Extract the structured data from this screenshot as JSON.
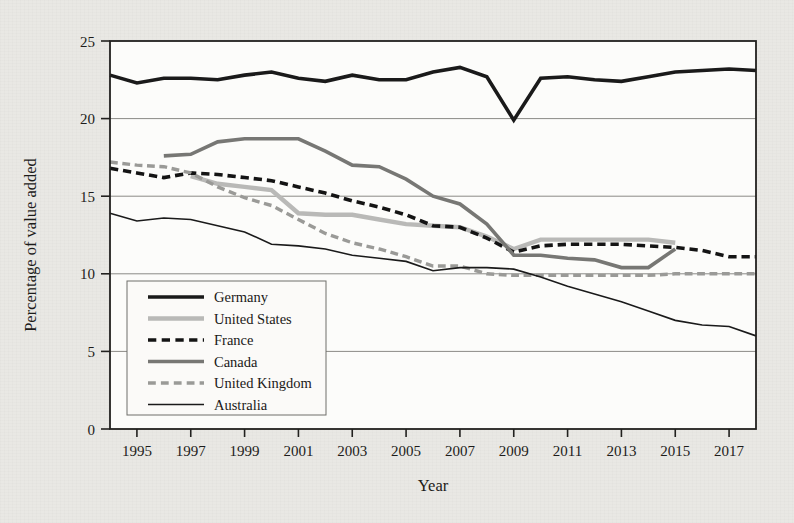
{
  "figure": {
    "background_color": "#e9e8e4",
    "plot_background_color": "#fcfcfa"
  },
  "chart_data": {
    "type": "line",
    "title": "",
    "xlabel": "Year",
    "ylabel": "Percentage of value added",
    "xlim": [
      1994,
      2018
    ],
    "ylim": [
      0,
      25
    ],
    "grid": "horizontal",
    "legend_position": "lower-left-inside",
    "x_tick_labels": [
      "1995",
      "1997",
      "1999",
      "2001",
      "2003",
      "2005",
      "2007",
      "2009",
      "2011",
      "2013",
      "2015",
      "2017"
    ],
    "x_ticks": [
      1995,
      1997,
      1999,
      2001,
      2003,
      2005,
      2007,
      2009,
      2011,
      2013,
      2015,
      2017
    ],
    "y_tick_labels": [
      "0",
      "5",
      "10",
      "15",
      "20",
      "25"
    ],
    "y_ticks": [
      0,
      5,
      10,
      15,
      20,
      25
    ],
    "series": [
      {
        "name": "Germany",
        "color": "#1a1a1a",
        "style": "solid",
        "width": 3.6,
        "x": [
          1994,
          1995,
          1996,
          1997,
          1998,
          1999,
          2000,
          2001,
          2002,
          2003,
          2004,
          2005,
          2006,
          2007,
          2008,
          2009,
          2010,
          2011,
          2012,
          2013,
          2014,
          2015,
          2016,
          2017,
          2018
        ],
        "values": [
          22.8,
          22.3,
          22.6,
          22.6,
          22.5,
          22.8,
          23.0,
          22.6,
          22.4,
          22.8,
          22.5,
          22.5,
          23.0,
          23.3,
          22.7,
          19.9,
          22.6,
          22.7,
          22.5,
          22.4,
          22.7,
          23.0,
          23.1,
          23.2,
          23.1
        ]
      },
      {
        "name": "United States",
        "color": "#b9b9b7",
        "style": "solid",
        "width": 4.4,
        "x": [
          1997,
          1998,
          1999,
          2000,
          2001,
          2002,
          2003,
          2004,
          2005,
          2006,
          2007,
          2008,
          2009,
          2010,
          2011,
          2012,
          2013,
          2014,
          2015
        ],
        "values": [
          16.3,
          15.8,
          15.6,
          15.4,
          13.9,
          13.8,
          13.8,
          13.5,
          13.2,
          13.1,
          13.0,
          12.4,
          11.6,
          12.2,
          12.2,
          12.2,
          12.2,
          12.2,
          12.0
        ]
      },
      {
        "name": "France",
        "color": "#141414",
        "style": "dashed",
        "width": 3.6,
        "x": [
          1994,
          1995,
          1996,
          1997,
          1998,
          1999,
          2000,
          2001,
          2002,
          2003,
          2004,
          2005,
          2006,
          2007,
          2008,
          2009,
          2010,
          2011,
          2012,
          2013,
          2014,
          2015,
          2016,
          2017,
          2018
        ],
        "values": [
          16.8,
          16.5,
          16.2,
          16.5,
          16.4,
          16.2,
          16.0,
          15.6,
          15.2,
          14.7,
          14.3,
          13.8,
          13.1,
          13.0,
          12.3,
          11.4,
          11.8,
          11.9,
          11.9,
          11.9,
          11.8,
          11.7,
          11.5,
          11.1,
          11.1
        ]
      },
      {
        "name": "Canada",
        "color": "#777774",
        "style": "solid",
        "width": 3.6,
        "x": [
          1996,
          1997,
          1998,
          1999,
          2000,
          2001,
          2002,
          2003,
          2004,
          2005,
          2006,
          2007,
          2008,
          2009,
          2010,
          2011,
          2012,
          2013,
          2014,
          2015
        ],
        "values": [
          17.6,
          17.7,
          18.5,
          18.7,
          18.7,
          18.7,
          17.9,
          17.0,
          16.9,
          16.1,
          15.0,
          14.5,
          13.2,
          11.2,
          11.2,
          11.0,
          10.9,
          10.4,
          10.4,
          11.6
        ]
      },
      {
        "name": "United Kingdom",
        "color": "#9a9a97",
        "style": "dashed",
        "width": 3.4,
        "x": [
          1994,
          1995,
          1996,
          1997,
          1998,
          1999,
          2000,
          2001,
          2002,
          2003,
          2004,
          2005,
          2006,
          2007,
          2008,
          2009,
          2010,
          2011,
          2012,
          2013,
          2014,
          2015,
          2016,
          2017,
          2018
        ],
        "values": [
          17.2,
          17.0,
          16.9,
          16.5,
          15.6,
          14.9,
          14.4,
          13.5,
          12.6,
          12.0,
          11.6,
          11.1,
          10.5,
          10.5,
          10.0,
          9.9,
          9.9,
          9.9,
          9.9,
          9.9,
          9.9,
          10.0,
          10.0,
          10.0,
          10.0
        ]
      },
      {
        "name": "Australia",
        "color": "#1a1a1a",
        "style": "solid",
        "width": 1.6,
        "x": [
          1994,
          1995,
          1996,
          1997,
          1998,
          1999,
          2000,
          2001,
          2002,
          2003,
          2004,
          2005,
          2006,
          2007,
          2008,
          2009,
          2010,
          2011,
          2012,
          2013,
          2014,
          2015,
          2016,
          2017,
          2018
        ],
        "values": [
          13.9,
          13.4,
          13.6,
          13.5,
          13.1,
          12.7,
          11.9,
          11.8,
          11.6,
          11.2,
          11.0,
          10.8,
          10.2,
          10.4,
          10.4,
          10.3,
          9.8,
          9.2,
          8.7,
          8.2,
          7.6,
          7.0,
          6.7,
          6.6,
          6.0
        ]
      }
    ]
  },
  "legend": {
    "entries": [
      {
        "label": "Germany"
      },
      {
        "label": "United States"
      },
      {
        "label": "France"
      },
      {
        "label": "Canada"
      },
      {
        "label": "United Kingdom"
      },
      {
        "label": "Australia"
      }
    ]
  }
}
